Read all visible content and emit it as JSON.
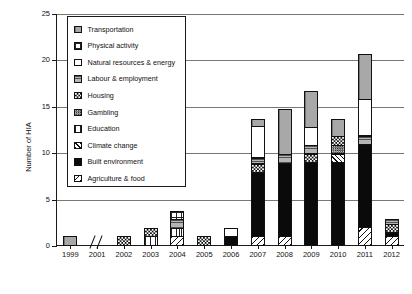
{
  "chart_data": {
    "type": "bar",
    "stacked": true,
    "title": "",
    "xlabel": "",
    "ylabel": "Number of HIA",
    "ylim": [
      0,
      25
    ],
    "yticks": [
      0,
      5,
      10,
      15,
      20,
      25
    ],
    "grid": "horizontal",
    "legend_position": "upper-left-inside",
    "axis_break_after_category": "1999",
    "categories": [
      "1999",
      "2001",
      "2002",
      "2003",
      "2004",
      "2005",
      "2006",
      "2007",
      "2008",
      "2009",
      "2010",
      "2011",
      "2012"
    ],
    "series": [
      {
        "name": "Agriculture & food",
        "key": "agriculture",
        "values": [
          0,
          0,
          0,
          0,
          1,
          0,
          0,
          1,
          1,
          0,
          0,
          2,
          1
        ]
      },
      {
        "name": "Built environment",
        "key": "built",
        "values": [
          0,
          0,
          0,
          0,
          0,
          0,
          1,
          7,
          8,
          9,
          9,
          9,
          0.5
        ]
      },
      {
        "name": "Climate change",
        "key": "climate",
        "values": [
          0,
          0,
          0,
          0,
          0,
          0,
          0,
          0,
          0,
          0,
          1,
          0,
          0
        ]
      },
      {
        "name": "Education",
        "key": "education",
        "values": [
          0,
          0,
          0,
          1,
          1,
          0,
          0,
          0,
          0,
          0,
          0,
          0,
          0
        ]
      },
      {
        "name": "Gambling",
        "key": "gambling",
        "values": [
          0,
          0,
          0,
          0,
          0,
          0,
          0,
          0,
          0,
          0,
          1,
          0,
          0
        ]
      },
      {
        "name": "Housing",
        "key": "housing",
        "values": [
          0,
          0,
          1,
          1,
          0,
          1,
          0,
          1,
          0,
          1,
          1,
          0,
          1
        ]
      },
      {
        "name": "Labour & employment",
        "key": "labour",
        "values": [
          0,
          0,
          0,
          0,
          1,
          0,
          0,
          0.7,
          1,
          1,
          0,
          1,
          0.6
        ]
      },
      {
        "name": "Natural resources & energy",
        "key": "natural",
        "values": [
          0,
          0,
          0,
          0,
          0,
          0,
          1,
          3.5,
          0,
          2,
          0,
          4,
          0
        ]
      },
      {
        "name": "Physical activity",
        "key": "physical",
        "values": [
          0,
          0,
          0,
          0,
          1,
          0,
          0,
          0,
          0,
          0,
          0,
          0,
          0
        ]
      },
      {
        "name": "Transportation",
        "key": "transportation",
        "values": [
          1,
          0,
          0,
          0,
          0,
          0,
          0,
          0.8,
          5,
          4,
          2,
          5,
          0
        ]
      }
    ],
    "totals": [
      1,
      0,
      1,
      2,
      4,
      1,
      2,
      14,
      15,
      17,
      14,
      21,
      4.5
    ],
    "stack_order_bottom_to_top": [
      "agriculture",
      "built",
      "climate",
      "education",
      "gambling",
      "housing",
      "labour",
      "natural",
      "physical",
      "transportation"
    ]
  },
  "legend": {
    "items": [
      {
        "label": "Transportation",
        "key": "transportation",
        "swatch": "solid-gray-vertical-ruled"
      },
      {
        "label": "Physical activity",
        "key": "physical",
        "swatch": "fine-grid"
      },
      {
        "label": "Natural resources & energy",
        "key": "natural",
        "swatch": "white-empty"
      },
      {
        "label": "Labour & employment",
        "key": "labour",
        "swatch": "gray-horizontal-lines"
      },
      {
        "label": "Housing",
        "key": "housing",
        "swatch": "checkerboard-coarse"
      },
      {
        "label": "Gambling",
        "key": "gambling",
        "swatch": "checkerboard-fine"
      },
      {
        "label": "Education",
        "key": "education",
        "swatch": "vertical-lines"
      },
      {
        "label": "Climate change",
        "key": "climate",
        "swatch": "diagonal-up-lines"
      },
      {
        "label": "Built environment",
        "key": "built",
        "swatch": "solid-black"
      },
      {
        "label": "Agriculture & food",
        "key": "agriculture",
        "swatch": "diagonal-down-lines"
      }
    ]
  },
  "axis": {
    "y_title": "Number of HIA",
    "y_tick_labels": [
      "0",
      "5",
      "10",
      "15",
      "20",
      "25"
    ],
    "x_tick_labels": [
      "1999",
      "2001",
      "2002",
      "2003",
      "2004",
      "2005",
      "2006",
      "2007",
      "2008",
      "2009",
      "2010",
      "2011",
      "2012"
    ]
  }
}
